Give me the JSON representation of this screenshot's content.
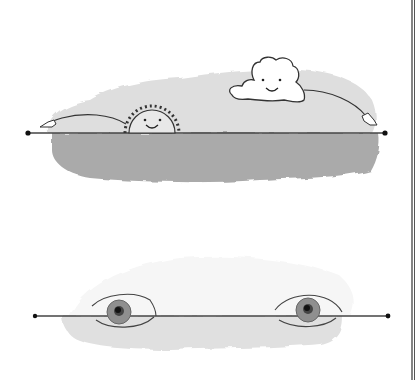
{
  "illustration": {
    "description": "Two hand-drawn horizon-line panels",
    "panel_top": {
      "subject": "Smiling sun rising and smiling cloud, both pointing with arms along a horizontal line; grey watercolor wash above and darker wash below the line",
      "line": {
        "x1": 28,
        "x2": 385,
        "y": 133
      },
      "colors": {
        "wash_light": "#dcdcdc",
        "wash_dark": "#a9a9a9",
        "ink": "#333333"
      }
    },
    "panel_bottom": {
      "subject": "Two eyes resting on a horizontal line over a light grey wash",
      "line": {
        "x1": 35,
        "x2": 388,
        "y": 316
      },
      "colors": {
        "wash_light": "#e2e2e2",
        "iris": "#8a8a8a",
        "pupil": "#1a1a1a",
        "ink": "#333333"
      }
    },
    "frame": {
      "right_border_x": 413,
      "color": "#333333"
    }
  }
}
